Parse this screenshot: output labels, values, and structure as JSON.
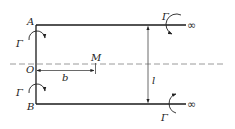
{
  "diagram": {
    "title": "",
    "points": {
      "A": "A",
      "B": "B",
      "O": "O",
      "M": "M"
    },
    "dimensions": {
      "b": "b",
      "l": "l"
    },
    "vortices": {
      "left_top": "Γ",
      "left_bottom": "Γ",
      "right_top": "Γ",
      "right_bottom": "Γ"
    },
    "infinity_top": "∞",
    "infinity_bottom": "∞",
    "colors": {
      "line": "#1a1a1a",
      "dashed": "#9a9a9a",
      "dimension": "#444444"
    }
  }
}
